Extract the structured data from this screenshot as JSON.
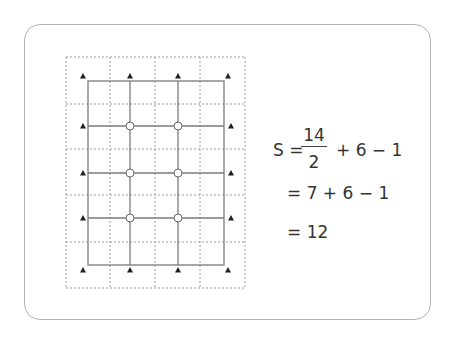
{
  "diagram": {
    "grid": {
      "dotted_columns_x": [
        66,
        110,
        155,
        200,
        245
      ],
      "dotted_rows_y": [
        57,
        104,
        149,
        195,
        242,
        288
      ],
      "solid_rect": {
        "x1": 88,
        "y1": 81,
        "x2": 224,
        "y2": 265
      },
      "solid_verticals_x": [
        130,
        178
      ],
      "solid_horizontals_y": [
        126,
        173,
        218
      ],
      "interior_points": [
        [
          130,
          126
        ],
        [
          178,
          126
        ],
        [
          130,
          173
        ],
        [
          178,
          173
        ],
        [
          130,
          218
        ],
        [
          178,
          218
        ]
      ],
      "boundary_points": [
        [
          83,
          76
        ],
        [
          130,
          76
        ],
        [
          178,
          76
        ],
        [
          228,
          76
        ],
        [
          83,
          126
        ],
        [
          231,
          126
        ],
        [
          83,
          173
        ],
        [
          231,
          173
        ],
        [
          83,
          218
        ],
        [
          231,
          218
        ],
        [
          83,
          270
        ],
        [
          130,
          270
        ],
        [
          178,
          270
        ],
        [
          228,
          270
        ]
      ],
      "colors": {
        "dotted": "#9a9a9a",
        "solid": "#7a7a7a",
        "marker": "#222222"
      }
    },
    "formula": {
      "line1": {
        "lhs": "S =",
        "numerator": "14",
        "denominator": "2",
        "rest": "+ 6 − 1"
      },
      "line2": "= 7 + 6 − 1",
      "line3": "= 12"
    },
    "counts": {
      "boundary": 14,
      "interior": 6,
      "area": 12
    }
  }
}
